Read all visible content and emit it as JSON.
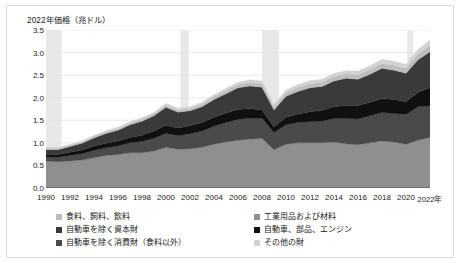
{
  "figure": {
    "axis_title": "2022年価格（兆ドル）"
  },
  "chart_data": {
    "type": "area",
    "stacked": true,
    "title": "",
    "subtitle": "",
    "xlabel": "",
    "ylabel": "2022年価格（兆ドル）",
    "ylim": [
      0.0,
      3.5
    ],
    "ytick_labels": [
      "0.0",
      "0.5",
      "1.0",
      "1.5",
      "2.0",
      "2.5",
      "3.0",
      "3.5"
    ],
    "ytick_values": [
      0.0,
      0.5,
      1.0,
      1.5,
      2.0,
      2.5,
      3.0,
      3.5
    ],
    "grid": true,
    "grid_axis": "y",
    "legend_position": "bottom",
    "legend_columns": 2,
    "x": [
      1990,
      1991,
      1992,
      1993,
      1994,
      1995,
      1996,
      1997,
      1998,
      1999,
      2000,
      2001,
      2002,
      2003,
      2004,
      2005,
      2006,
      2007,
      2008,
      2009,
      2010,
      2011,
      2012,
      2013,
      2014,
      2015,
      2016,
      2017,
      2018,
      2019,
      2020,
      2021,
      2022
    ],
    "xtick_labels": [
      "1990",
      "1992",
      "1994",
      "1996",
      "1998",
      "2000",
      "2002",
      "2004",
      "2006",
      "2008",
      "2010",
      "2012",
      "2014",
      "2016",
      "2018",
      "2020",
      "2022年"
    ],
    "xtick_values": [
      1990,
      1992,
      1994,
      1996,
      1998,
      2000,
      2002,
      2004,
      2006,
      2008,
      2010,
      2012,
      2014,
      2016,
      2018,
      2020,
      2022
    ],
    "series": [
      {
        "name": "工業用品および材料",
        "color": "#8f8f8f",
        "order": 1,
        "values": [
          0.6,
          0.58,
          0.6,
          0.62,
          0.67,
          0.72,
          0.74,
          0.78,
          0.78,
          0.82,
          0.9,
          0.86,
          0.87,
          0.9,
          0.97,
          1.02,
          1.06,
          1.08,
          1.1,
          0.85,
          0.97,
          1.0,
          1.0,
          1.0,
          1.02,
          0.98,
          0.96,
          1.0,
          1.04,
          1.02,
          0.97,
          1.06,
          1.12
        ]
      },
      {
        "name": "自動車を除く消費財（食料以外）",
        "color": "#4a4a4a",
        "order": 2,
        "values": [
          0.09,
          0.1,
          0.12,
          0.14,
          0.16,
          0.17,
          0.19,
          0.22,
          0.25,
          0.28,
          0.31,
          0.3,
          0.33,
          0.36,
          0.4,
          0.43,
          0.46,
          0.47,
          0.45,
          0.38,
          0.43,
          0.45,
          0.47,
          0.48,
          0.52,
          0.56,
          0.57,
          0.6,
          0.63,
          0.63,
          0.66,
          0.74,
          0.7
        ]
      },
      {
        "name": "自動車、部品、エンジン",
        "color": "#101010",
        "order": 3,
        "values": [
          0.06,
          0.06,
          0.07,
          0.08,
          0.1,
          0.1,
          0.11,
          0.12,
          0.14,
          0.16,
          0.18,
          0.17,
          0.18,
          0.19,
          0.2,
          0.21,
          0.22,
          0.21,
          0.18,
          0.12,
          0.17,
          0.19,
          0.22,
          0.24,
          0.26,
          0.29,
          0.3,
          0.3,
          0.31,
          0.31,
          0.28,
          0.32,
          0.4
        ]
      },
      {
        "name": "自動車を除く資本財",
        "color": "#3a3a3a",
        "order": 4,
        "values": [
          0.1,
          0.11,
          0.13,
          0.15,
          0.18,
          0.22,
          0.24,
          0.28,
          0.31,
          0.34,
          0.4,
          0.35,
          0.33,
          0.35,
          0.39,
          0.43,
          0.48,
          0.5,
          0.5,
          0.38,
          0.46,
          0.5,
          0.53,
          0.53,
          0.57,
          0.6,
          0.58,
          0.62,
          0.67,
          0.65,
          0.63,
          0.72,
          0.8
        ]
      },
      {
        "name": "食料、飼料、飲料",
        "color": "#bdbdbd",
        "order": 5,
        "values": [
          0.03,
          0.03,
          0.03,
          0.03,
          0.04,
          0.04,
          0.04,
          0.04,
          0.05,
          0.05,
          0.05,
          0.05,
          0.05,
          0.06,
          0.06,
          0.07,
          0.07,
          0.08,
          0.08,
          0.07,
          0.08,
          0.09,
          0.09,
          0.09,
          0.1,
          0.1,
          0.1,
          0.11,
          0.11,
          0.11,
          0.11,
          0.13,
          0.15
        ]
      },
      {
        "name": "その他の財",
        "color": "#d2d2d2",
        "order": 6,
        "values": [
          0.02,
          0.02,
          0.02,
          0.02,
          0.02,
          0.02,
          0.03,
          0.03,
          0.03,
          0.03,
          0.04,
          0.04,
          0.04,
          0.04,
          0.05,
          0.05,
          0.05,
          0.06,
          0.06,
          0.05,
          0.06,
          0.06,
          0.07,
          0.07,
          0.07,
          0.07,
          0.08,
          0.08,
          0.09,
          0.09,
          0.09,
          0.1,
          0.11
        ]
      }
    ],
    "shaded_bands": [
      {
        "from": 1990.0,
        "to": 1991.3,
        "color": "#e8e8e8"
      },
      {
        "from": 2001.2,
        "to": 2001.9,
        "color": "#e8e8e8"
      },
      {
        "from": 2008.0,
        "to": 2009.4,
        "color": "#e8e8e8"
      },
      {
        "from": 2020.1,
        "to": 2020.6,
        "color": "#e8e8e8"
      }
    ]
  },
  "legend": {
    "left_column": [
      {
        "label": "食料、飼料、飲料",
        "color": "#bdbdbd"
      },
      {
        "label": "自動車を除く資本財",
        "color": "#3a3a3a"
      },
      {
        "label": "自動車を除く消費財（食料以外）",
        "color": "#4a4a4a"
      }
    ],
    "right_column": [
      {
        "label": "工業用品および材料",
        "color": "#8f8f8f"
      },
      {
        "label": "自動車、部品、エンジン",
        "color": "#101010"
      },
      {
        "label": "その他の財",
        "color": "#d2d2d2"
      }
    ]
  }
}
